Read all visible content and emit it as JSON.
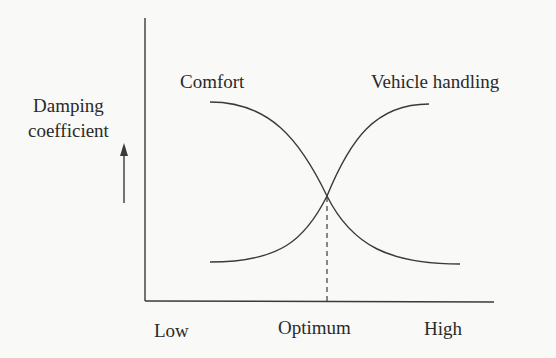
{
  "diagram": {
    "type": "damping-tradeoff",
    "y_axis": {
      "label_line1": "Damping",
      "label_line2": "coefficient",
      "arrow": "up-arrow"
    },
    "x_axis": {
      "ticks": [
        "Low",
        "Optimum",
        "High"
      ]
    },
    "curves": [
      {
        "name": "Comfort",
        "trend": "decreasing"
      },
      {
        "name": "Vehicle handling",
        "trend": "increasing"
      }
    ],
    "optimum_marker": "dashed vertical line at curve intersection",
    "colors": {
      "line": "#3a3a3a",
      "background": "#f9f9f7"
    }
  }
}
